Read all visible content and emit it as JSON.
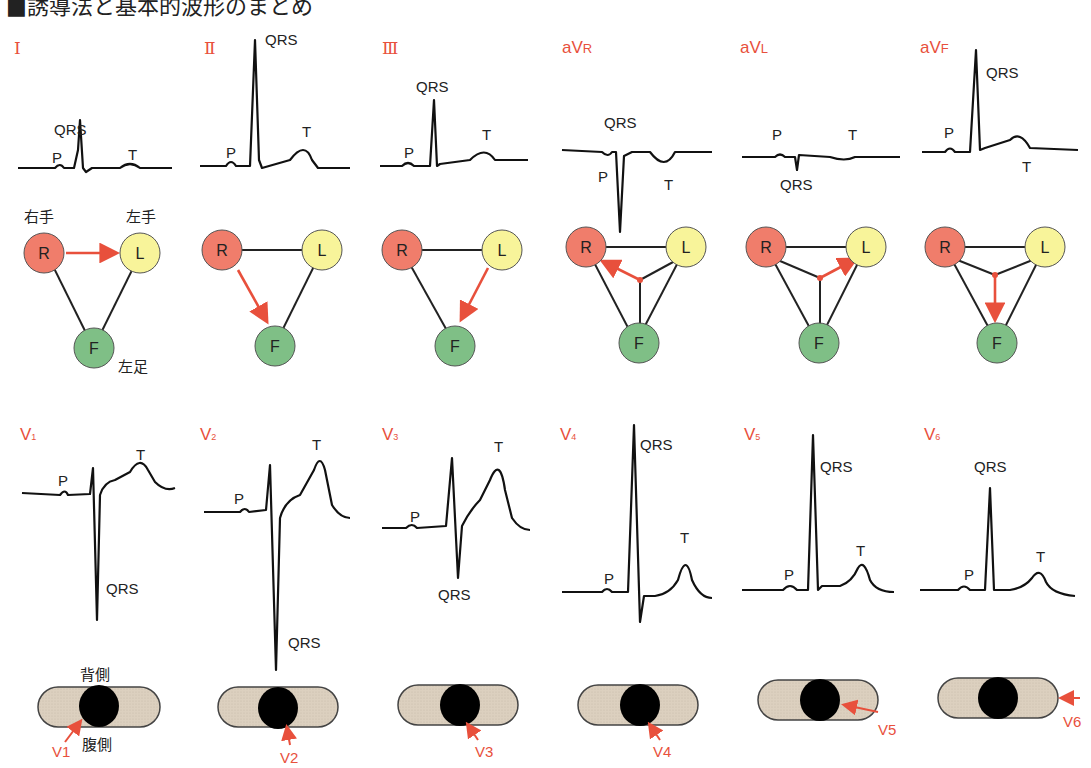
{
  "title": "■誘導法と基本的波形のまとめ",
  "colors": {
    "red": "#e8503c",
    "R": "#f07d6b",
    "L": "#f8f49a",
    "F": "#7fbf86",
    "body": "#dcd0bf"
  },
  "limb_leads": [
    {
      "label": "Ⅰ",
      "waves": {
        "p": "P",
        "qrs": "QRS",
        "t": "T"
      }
    },
    {
      "label": "Ⅱ",
      "waves": {
        "p": "P",
        "qrs": "QRS",
        "t": "T"
      }
    },
    {
      "label": "Ⅲ",
      "waves": {
        "p": "P",
        "qrs": "QRS",
        "t": "T"
      }
    },
    {
      "label": "aVR",
      "waves": {
        "p": "P",
        "qrs": "QRS",
        "t": "T"
      }
    },
    {
      "label": "aVL",
      "waves": {
        "p": "P",
        "qrs": "QRS",
        "t": "T"
      }
    },
    {
      "label": "aVF",
      "waves": {
        "p": "P",
        "qrs": "QRS",
        "t": "T"
      }
    }
  ],
  "limb_electrodes": {
    "r": "R",
    "l": "L",
    "f": "F",
    "right_hand": "右手",
    "left_hand": "左手",
    "left_foot": "左足"
  },
  "chest_leads": [
    {
      "label": "V1",
      "arrow": "V1"
    },
    {
      "label": "V2",
      "arrow": "V2"
    },
    {
      "label": "V3",
      "arrow": "V3"
    },
    {
      "label": "V4",
      "arrow": "V4"
    },
    {
      "label": "V5",
      "arrow": "V5"
    },
    {
      "label": "V6",
      "arrow": "V6"
    }
  ],
  "chest_wave_labels": {
    "p": "P",
    "qrs": "QRS",
    "t": "T"
  },
  "body_section": {
    "dorsal": "背側",
    "ventral": "腹側"
  }
}
